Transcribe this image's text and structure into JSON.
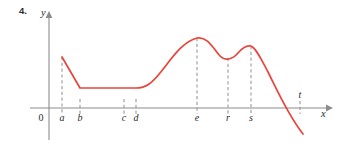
{
  "figure": {
    "exercise_number": "4.",
    "axis_labels": {
      "y": "y",
      "x": "x"
    },
    "origin_label": "0",
    "curve_color": "#e8443c",
    "axis_color": "#8c8c8c",
    "dash_color": "#9a9a9a",
    "tick_labels": [
      {
        "name": "a",
        "label": "a",
        "x": 62
      },
      {
        "name": "b",
        "label": "b",
        "x": 80
      },
      {
        "name": "c",
        "label": "c",
        "x": 124
      },
      {
        "name": "d",
        "label": "d",
        "x": 136
      },
      {
        "name": "e",
        "label": "e",
        "x": 197
      },
      {
        "name": "r",
        "label": "r",
        "x": 228
      },
      {
        "name": "s",
        "label": "s",
        "x": 251
      },
      {
        "name": "t",
        "label": "t",
        "x": 300
      }
    ]
  },
  "chart_data": {
    "type": "line",
    "title": "",
    "xlabel": "x",
    "ylabel": "y",
    "grid": false,
    "legend": null,
    "axes": {
      "x_axis_y_px": 108,
      "y_axis_x_px": 49,
      "x_axis_start_px": 30,
      "x_axis_end_px": 330,
      "y_axis_top_px": 14,
      "y_axis_bottom_px": 140
    },
    "marked_x_values": [
      "a",
      "b",
      "c",
      "d",
      "e",
      "r",
      "s",
      "t"
    ],
    "annotations": [
      "curve begins at x = a with a corner, above the axis",
      "linear decrease from a to b",
      "constant (horizontal) from b through c to d",
      "corner at d, then increasing concave-up then concave-down to local maximum at e",
      "decreasing from e to local minimum at r",
      "increasing from r to local maximum at s",
      "decreasing from s, crossing the x-axis just before t, continuing below the axis"
    ],
    "series": [
      {
        "name": "f",
        "color": "#e8443c",
        "points_px": [
          [
            62,
            57
          ],
          [
            80,
            88
          ],
          [
            124,
            88
          ],
          [
            136,
            88
          ],
          [
            150,
            80
          ],
          [
            165,
            67
          ],
          [
            180,
            52
          ],
          [
            197,
            38
          ],
          [
            212,
            43
          ],
          [
            228,
            58
          ],
          [
            240,
            50
          ],
          [
            251,
            46
          ],
          [
            265,
            55
          ],
          [
            280,
            78
          ],
          [
            295,
            108
          ],
          [
            303,
            134
          ]
        ],
        "path_d": "M 62 57 L 80 88 L 136 88 C 146 88 152 83 160 73 C 172 58 182 42 197 38 C 208 36 214 50 220 56 C 225 61 232 60 238 53 C 243 47 247 45 251 46 C 256 48 261 59 268 72 C 277 90 288 115 303 134"
      }
    ],
    "dashed_guides": [
      {
        "x": 62,
        "y_top": 57,
        "y_bottom": 115,
        "label": "a"
      },
      {
        "x": 80,
        "y_top": 100,
        "y_bottom": 115,
        "label": "b"
      },
      {
        "x": 124,
        "y_top": 100,
        "y_bottom": 115,
        "label": "c"
      },
      {
        "x": 136,
        "y_top": 100,
        "y_bottom": 115,
        "label": "d"
      },
      {
        "x": 197,
        "y_top": 38,
        "y_bottom": 115,
        "label": "e"
      },
      {
        "x": 228,
        "y_top": 58,
        "y_bottom": 115,
        "label": "r"
      },
      {
        "x": 251,
        "y_top": 46,
        "y_bottom": 115,
        "label": "s"
      },
      {
        "x": 300,
        "y_top": 101,
        "y_bottom": 114,
        "label": "t"
      }
    ]
  }
}
